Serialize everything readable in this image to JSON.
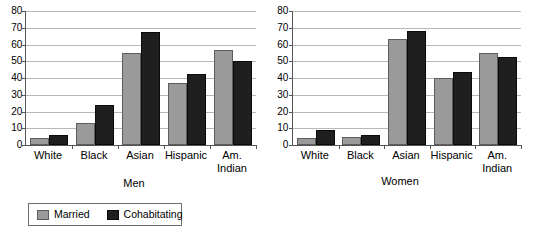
{
  "chart_data": [
    {
      "type": "bar",
      "title": "",
      "xlabel": "Men",
      "ylabel": "",
      "categories": [
        "White",
        "Black",
        "Asian",
        "Hispanic",
        "Am.\nIndian"
      ],
      "series": [
        {
          "name": "Married",
          "color": "#9a9a9a",
          "values": [
            4,
            13,
            55,
            37,
            57
          ]
        },
        {
          "name": "Cohabitating",
          "color": "#1f1f1f",
          "values": [
            6,
            24,
            67.5,
            42.5,
            50
          ]
        }
      ],
      "ylim": [
        0,
        80
      ],
      "yticks": [
        0,
        10,
        20,
        30,
        40,
        50,
        60,
        70,
        80
      ],
      "grid": true,
      "legend_position": "bottom-outside"
    },
    {
      "type": "bar",
      "title": "",
      "xlabel": "Women",
      "ylabel": "",
      "categories": [
        "White",
        "Black",
        "Asian",
        "Hispanic",
        "Am.\nIndian"
      ],
      "series": [
        {
          "name": "Married",
          "color": "#9a9a9a",
          "values": [
            4,
            4.5,
            63,
            40,
            55
          ]
        },
        {
          "name": "Cohabitating",
          "color": "#1f1f1f",
          "values": [
            9,
            6,
            68,
            43.5,
            52.5
          ]
        }
      ],
      "ylim": [
        0,
        80
      ],
      "yticks": [
        0,
        10,
        20,
        30,
        40,
        50,
        60,
        70,
        80
      ],
      "grid": true,
      "legend_position": "bottom-outside"
    }
  ],
  "legend": {
    "entries": [
      {
        "label": "Married",
        "color": "#9a9a9a"
      },
      {
        "label": "Cohabitating",
        "color": "#1f1f1f"
      }
    ]
  }
}
